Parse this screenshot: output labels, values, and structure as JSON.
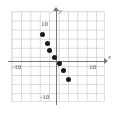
{
  "chart_data": {
    "type": "scatter",
    "title": "",
    "subtitle": "",
    "xlabel": "x",
    "ylabel": "y",
    "xlim": [
      -11,
      11
    ],
    "ylim": [
      -11,
      11
    ],
    "grid": true,
    "grid_step": 2,
    "legend": "none",
    "x_tick_labels": [
      "-10",
      "10"
    ],
    "y_tick_labels": [
      "10",
      "-10"
    ],
    "x_ticks": [
      -10,
      10
    ],
    "y_ticks": [
      10,
      -10
    ],
    "points": [
      {
        "x": -3.0,
        "y": 6.0
      },
      {
        "x": -2.0,
        "y": 4.0
      },
      {
        "x": -1.5,
        "y": 2.5
      },
      {
        "x": -0.5,
        "y": 1.0
      },
      {
        "x": 0.5,
        "y": -0.5
      },
      {
        "x": 1.5,
        "y": -2.0
      },
      {
        "x": 2.5,
        "y": -4.0
      }
    ],
    "series": [
      {
        "name": "data",
        "x": [
          -3.0,
          -2.0,
          -1.5,
          -0.5,
          0.5,
          1.5,
          2.5
        ],
        "values": [
          6.0,
          4.0,
          2.5,
          1.0,
          -0.5,
          -2.0,
          -4.0
        ]
      }
    ],
    "point_color": "#1a1a1a",
    "axis_color": "#77777a",
    "grid_color": "#d8d8d8"
  },
  "axes": {
    "x_name": "x",
    "y_name": "y",
    "x_label_negative": "-10",
    "x_label_positive": "10",
    "y_label_positive": "10",
    "y_label_negative": "-10"
  }
}
